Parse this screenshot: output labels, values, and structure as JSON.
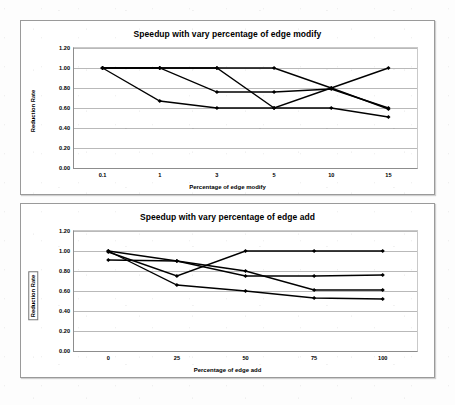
{
  "document": {
    "background_color": "#fdfdfd",
    "ink_color": "#000000",
    "gridline_color": "#b9b9b9"
  },
  "chart_data": [
    {
      "id": "edge-modify",
      "type": "line",
      "title": "Speedup with vary percentage of edge modify",
      "xlabel": "Percentage of edge modify",
      "ylabel": "Reduction Rate",
      "categories": [
        "0.1",
        "1",
        "3",
        "5",
        "10",
        "15"
      ],
      "yticks": [
        "0.00",
        "0.20",
        "0.40",
        "0.60",
        "0.80",
        "1.00",
        "1.20"
      ],
      "ylim": [
        0.0,
        1.2
      ],
      "grid": true,
      "legend_position": "top-inside",
      "series": [
        {
          "name": "tcas",
          "values": [
            1.0,
            1.0,
            1.0,
            0.6,
            0.8,
            1.0
          ]
        },
        {
          "name": "totinfo",
          "values": [
            1.0,
            1.0,
            0.76,
            0.76,
            0.79,
            0.6
          ]
        },
        {
          "name": "schedule",
          "values": [
            1.0,
            0.67,
            0.6,
            0.6,
            0.6,
            0.51
          ]
        },
        {
          "name": "printtokens",
          "values": [
            1.0,
            1.0,
            1.0,
            1.0,
            0.8,
            0.59
          ]
        }
      ]
    },
    {
      "id": "edge-add",
      "type": "line",
      "title": "Speedup with vary percentage of edge add",
      "xlabel": "Percentage of edge add",
      "ylabel": "Reduction Rate",
      "categories": [
        "0",
        "25",
        "50",
        "75",
        "100"
      ],
      "yticks": [
        "0.00",
        "0.20",
        "0.40",
        "0.60",
        "0.80",
        "1.00",
        "1.20"
      ],
      "ylim": [
        0.0,
        1.2
      ],
      "grid": true,
      "legend_position": "top-inside",
      "series": [
        {
          "name": "printtokens2",
          "values": [
            0.99,
            0.75,
            1.0,
            1.0,
            1.0
          ]
        },
        {
          "name": "replace",
          "values": [
            1.0,
            0.9,
            0.8,
            0.61,
            0.61
          ]
        },
        {
          "name": "schedule2",
          "values": [
            0.91,
            0.9,
            0.75,
            0.75,
            0.76
          ]
        },
        {
          "name": "space",
          "values": [
            1.0,
            0.66,
            0.6,
            0.53,
            0.52
          ]
        }
      ]
    }
  ]
}
